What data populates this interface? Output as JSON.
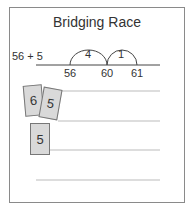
{
  "title": "Bridging Race",
  "expression": "56 + 5",
  "number_line": {
    "ticks": [
      {
        "label": "56",
        "x": 70
      },
      {
        "label": "60",
        "x": 107
      },
      {
        "label": "61",
        "x": 137
      }
    ],
    "jumps": [
      {
        "label": "4",
        "from": "56",
        "to": "60"
      },
      {
        "label": "1",
        "from": "60",
        "to": "61"
      }
    ]
  },
  "cards": [
    {
      "value": "6"
    },
    {
      "value": "5"
    },
    {
      "value": "5"
    }
  ],
  "colors": {
    "card_fill": "#d9d9d9",
    "line": "#bbbbbb",
    "border": "#8a8a8a"
  }
}
